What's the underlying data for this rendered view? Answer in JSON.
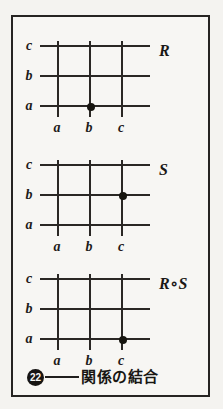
{
  "figure": {
    "caption_number": "22",
    "caption_text": "関係の結合",
    "row_labels": [
      "c",
      "b",
      "a"
    ],
    "col_labels": [
      "a",
      "b",
      "c"
    ],
    "panels": [
      {
        "name": "R",
        "point": {
          "col": "b",
          "row": "a"
        }
      },
      {
        "name": "S",
        "point": {
          "col": "c",
          "row": "b"
        }
      },
      {
        "name": "R∘S",
        "point": {
          "col": "c",
          "row": "a"
        }
      }
    ]
  },
  "colors": {
    "ink": "#1d1b19",
    "paper": "#f7f6f3",
    "page": "#f3f2ef"
  }
}
